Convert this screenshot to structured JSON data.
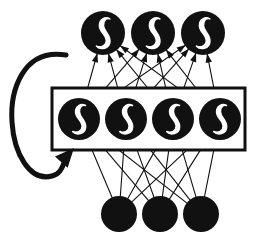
{
  "figure": {
    "name": "recurrent-neural-network-diagram",
    "type": "diagram",
    "width": 261,
    "height": 239,
    "background_color": "#ffffff",
    "ink_color": "#111111",
    "node_fill_color": "#111111",
    "activation_symbol_color": "#ffffff"
  },
  "layers": [
    {
      "id": "output-layer",
      "role": "output",
      "node_count": 3,
      "node_radius": 22,
      "has_activation_symbol": true,
      "activation_symbol": "sigmoid-curve",
      "nodes": [
        {
          "id": "output-1",
          "cx": 103,
          "cy": 33
        },
        {
          "id": "output-2",
          "cx": 153,
          "cy": 33
        },
        {
          "id": "output-3",
          "cx": 203,
          "cy": 33
        }
      ]
    },
    {
      "id": "hidden-layer",
      "role": "hidden",
      "node_count": 4,
      "node_radius": 21,
      "has_activation_symbol": true,
      "activation_symbol": "sigmoid-curve",
      "nodes": [
        {
          "id": "hidden-1",
          "cx": 79,
          "cy": 119
        },
        {
          "id": "hidden-2",
          "cx": 126,
          "cy": 119
        },
        {
          "id": "hidden-3",
          "cx": 173,
          "cy": 119
        },
        {
          "id": "hidden-4",
          "cx": 220,
          "cy": 119
        }
      ]
    },
    {
      "id": "input-layer",
      "role": "input",
      "node_count": 3,
      "node_radius": 18,
      "has_activation_symbol": false,
      "activation_symbol": "none",
      "nodes": [
        {
          "id": "input-1",
          "cx": 119,
          "cy": 214
        },
        {
          "id": "input-2",
          "cx": 160,
          "cy": 214
        },
        {
          "id": "input-3",
          "cx": 201,
          "cy": 214
        }
      ]
    }
  ],
  "context_box": {
    "id": "hidden-layer-box",
    "x": 52,
    "y": 88,
    "width": 193,
    "height": 62,
    "stroke_width": 3,
    "fill": "none"
  },
  "recurrent_loop": {
    "id": "recurrent-feedback-arrow",
    "description": "large counterclockwise loop from hidden layer box back into itself",
    "stroke_width": 5,
    "path": "M 66,55 C 22,48 10,92 12,122 C 14,154 30,182 52,176 C 60,174 62,168 64,163",
    "arrow_tip": {
      "x": 74,
      "y": 148
    },
    "arrow_angle_deg": -48
  },
  "connections": {
    "input_to_hidden": {
      "from_layer": "input-layer",
      "to_layer": "hidden-layer",
      "fully_connected": true,
      "count": 12,
      "arrowheads": true,
      "stroke_width": 1.1
    },
    "hidden_to_output": {
      "from_layer": "hidden-layer",
      "to_layer": "output-layer",
      "fully_connected": true,
      "count": 12,
      "arrowheads": true,
      "stroke_width": 1.1
    }
  }
}
